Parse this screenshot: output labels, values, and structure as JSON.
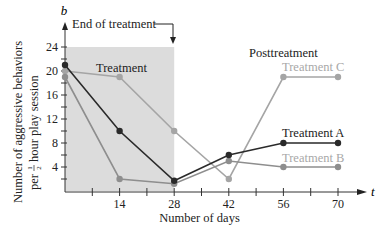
{
  "chart_data": {
    "type": "line",
    "title": "",
    "xlabel": "Number of days",
    "ylabel_line1": "Number of aggressive behaviors",
    "ylabel_line2_prefix": "per",
    "ylabel_fraction_num": "1",
    "ylabel_fraction_den": "2",
    "ylabel_line2_suffix": "hour play session",
    "x_axis_var": "t",
    "y_axis_var": "b",
    "x_ticks": [
      14,
      28,
      42,
      56,
      70
    ],
    "y_ticks": [
      4,
      8,
      12,
      16,
      20,
      24
    ],
    "xlim": [
      0,
      70
    ],
    "ylim": [
      0,
      24
    ],
    "x": [
      0,
      14,
      28,
      42,
      56,
      70
    ],
    "series": [
      {
        "name": "Treatment A",
        "color": "#2a2a2a",
        "label_color": "#222222",
        "values": [
          21,
          10,
          1.7,
          6,
          8,
          8
        ]
      },
      {
        "name": "Treatment B",
        "color": "#8e8e8e",
        "label_color": "#a8a8a8",
        "values": [
          19,
          2,
          1.2,
          5,
          4,
          4
        ]
      },
      {
        "name": "Treatment C",
        "color": "#a5a5a5",
        "label_color": "#a8a8a8",
        "values": [
          20,
          19,
          10,
          2,
          19,
          19
        ]
      }
    ],
    "annotations": {
      "treatment_region_label": "Treatment",
      "posttreatment_label": "Posttreatment",
      "end_of_treatment": "End of treatment",
      "shaded_region": [
        0,
        28
      ],
      "shade_color": "#dcdcdc"
    },
    "grid": false,
    "legend": "inline labels near line ends"
  }
}
